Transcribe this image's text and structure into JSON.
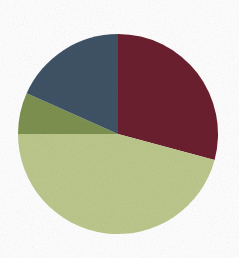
{
  "canvas": {
    "width": 239,
    "height": 258,
    "background_color": "#ffffff"
  },
  "chart_data": {
    "type": "pie",
    "title": "",
    "subtitle": "",
    "xlabel": "",
    "ylabel": "",
    "legend": "none",
    "grid": false,
    "labels_shown": false,
    "start_angle_deg": 0,
    "direction": "clockwise",
    "center": {
      "x": 118,
      "y": 134
    },
    "radius": 100,
    "categories": [
      "Dark Red",
      "Light Green",
      "Olive Green",
      "Slate Blue"
    ],
    "values": [
      29,
      46,
      7,
      18
    ],
    "value_unit": "percent",
    "slices": [
      {
        "name": "Dark Red",
        "value": 29,
        "percent": "29%",
        "color": "#6b1f2e",
        "start_deg": 0,
        "end_deg": 105
      },
      {
        "name": "Light Green",
        "value": 46,
        "percent": "46%",
        "color": "#bcc88c",
        "start_deg": 105,
        "end_deg": 270
      },
      {
        "name": "Olive Green",
        "value": 7,
        "percent": "7%",
        "color": "#7d9150",
        "start_deg": 270,
        "end_deg": 294
      },
      {
        "name": "Slate Blue",
        "value": 18,
        "percent": "18%",
        "color": "#3f5366",
        "start_deg": 294,
        "end_deg": 360
      }
    ]
  }
}
